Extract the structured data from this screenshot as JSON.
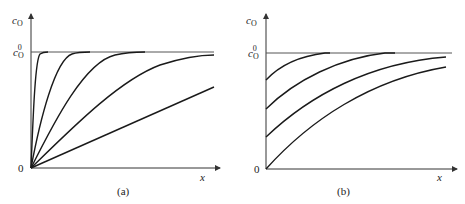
{
  "panels": [
    {
      "id": "a",
      "caption": "(a)",
      "y_label": "c",
      "y_label_sub": "O",
      "ref_label": "c",
      "ref_label_sub": "O",
      "ref_label_sup": "0",
      "origin_label": "0",
      "x_label": "x",
      "curves": [
        "M31,168 C33,120 35,60 40,54 C43,52 46,52 48,52",
        "M31,168 C40,120 55,60 72,54 C78,52 84,52 90,52",
        "M31,168 C55,120 85,62 115,55 C128,52 136,52 145,52",
        "M31,168 C75,125 120,80 160,65 C185,57 200,55 214,55",
        "M31,168 L214,87"
      ]
    },
    {
      "id": "b",
      "caption": "(b)",
      "y_label": "c",
      "y_label_sub": "O",
      "ref_label": "c",
      "ref_label_sub": "O",
      "ref_label_sup": "0",
      "origin_label": "0",
      "x_label": "x",
      "curves": [
        "M266,80 C280,65 300,56 325,53 L330,53",
        "M266,109 C295,80 340,58 385,53 L395,53",
        "M266,137 C310,95 370,63 446,57",
        "M266,169 C310,120 370,80 446,67"
      ]
    }
  ]
}
